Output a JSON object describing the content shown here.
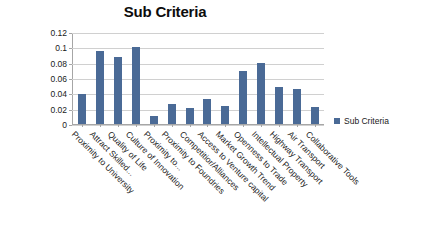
{
  "chart_data": {
    "type": "bar",
    "title": "Sub Criteria",
    "xlabel": "",
    "ylabel": "",
    "ylim": [
      0,
      0.12
    ],
    "yticks": [
      0,
      0.02,
      0.04,
      0.06,
      0.08,
      0.1,
      0.12
    ],
    "ytick_labels": [
      "0",
      "0.02",
      "0.04",
      "0.06",
      "0.08",
      "0.1",
      "0.12"
    ],
    "grid": true,
    "legend": [
      "Sub Criteria"
    ],
    "legend_position": "right",
    "series_color": "#4A6A96",
    "categories": [
      "Proximity to University",
      "Attract Skilled...",
      "Quality of Life",
      "Culture of Innovation",
      "Proximity to...",
      "Proximity to Foundries",
      "Competitior/Alliances",
      "Access to Venture capital",
      "Market Growth Trend",
      "Openness to Trade",
      "Intellectual Property",
      "Highway Transport",
      "Air Transport",
      "Collaborative Tools"
    ],
    "series": [
      {
        "name": "Sub Criteria",
        "values": [
          0.04,
          0.096,
          0.089,
          0.102,
          0.01,
          0.026,
          0.021,
          0.033,
          0.024,
          0.07,
          0.08,
          0.049,
          0.046,
          0.022
        ]
      }
    ]
  },
  "legend": {
    "label": "Sub Criteria"
  }
}
